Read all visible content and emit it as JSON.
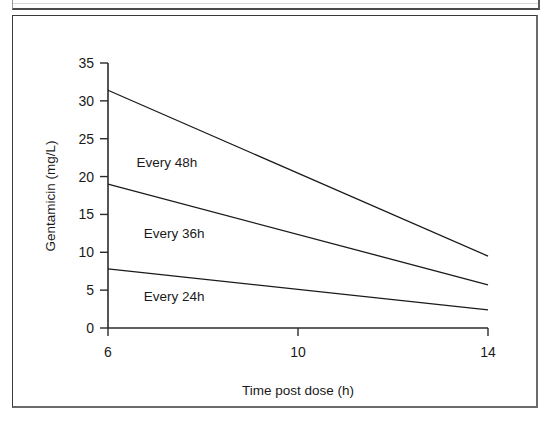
{
  "figure": {
    "background_color": "#ffffff",
    "frame_color": "#3a3a3a",
    "line_color": "#1a1a1a",
    "text_color": "#1a1a1a"
  },
  "chart_data": {
    "type": "line",
    "title": "",
    "subtitle": "",
    "xlabel": "Time post dose (h)",
    "ylabel": "Gentamicin (mg/L)",
    "x": [
      6,
      14
    ],
    "xlim": [
      6,
      14
    ],
    "ylim": [
      0,
      35
    ],
    "xticks": [
      6,
      10,
      14
    ],
    "xtick_labels": [
      "6",
      "10",
      "14"
    ],
    "yticks": [
      0,
      5,
      10,
      15,
      20,
      25,
      30,
      35
    ],
    "ytick_labels": [
      "0",
      "5",
      "10",
      "15",
      "20",
      "25",
      "30",
      "35"
    ],
    "grid": false,
    "legend": "inline-annotations",
    "series": [
      {
        "name": "Every 48h",
        "label": "Every 48h",
        "values": [
          31.4,
          9.5
        ],
        "label_x": 6.6,
        "label_y": 21.2
      },
      {
        "name": "Every 36h",
        "label": "Every 36h",
        "values": [
          19.0,
          5.7
        ],
        "label_x": 6.75,
        "label_y": 11.9
      },
      {
        "name": "Every 24h",
        "label": "Every 24h",
        "values": [
          7.8,
          2.4
        ],
        "label_x": 6.75,
        "label_y": 3.6
      }
    ],
    "annotations": [
      "Every 48h",
      "Every 36h",
      "Every 24h"
    ]
  }
}
